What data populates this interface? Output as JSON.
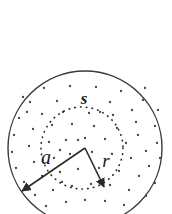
{
  "figure": {
    "type": "geometry-diagram",
    "canvas": {
      "width": 172,
      "height": 214,
      "background": "#ffffff"
    },
    "colors": {
      "outer_circle_stroke": "#3a3a3a",
      "inner_circle_stroke": "#2b2b2b",
      "point_fill": "#444444",
      "arrow_stroke": "#2a2a2a",
      "label_color": "#1a1a1a"
    },
    "outer_circle": {
      "name": "outer-circle",
      "center_x": 85,
      "center_y": 148,
      "radius": 77,
      "stroke_width": 1.4,
      "style": "solid"
    },
    "inner_circle": {
      "name": "inner-circle",
      "center_x": 82,
      "center_y": 148,
      "radius": 41,
      "stroke_width": 1.6,
      "style": "dotted"
    },
    "vertex": {
      "x": 85,
      "y": 148
    },
    "arrows": [
      {
        "id": "arrow-a",
        "label": "a",
        "from_x": 85,
        "from_y": 148,
        "to_x": 22,
        "to_y": 191,
        "label_x": 46,
        "label_y": 164,
        "meaning": "outer radius"
      },
      {
        "id": "arrow-r",
        "label": "r",
        "from_x": 85,
        "from_y": 148,
        "to_x": 104,
        "to_y": 187,
        "label_x": 106,
        "label_y": 167,
        "meaning": "inner radius"
      }
    ],
    "labels": [
      {
        "id": "label-s",
        "text": "s",
        "x": 84,
        "y": 104,
        "meaning": "arc or surface label on dotted circle"
      },
      {
        "id": "label-a",
        "text": "a",
        "x": 46,
        "y": 164,
        "meaning": "outer radius label"
      },
      {
        "id": "label-r",
        "text": "r",
        "x": 106,
        "y": 167,
        "meaning": "inner radius label"
      }
    ],
    "points": [
      [
        44,
        88
      ],
      [
        70,
        86
      ],
      [
        96,
        87
      ],
      [
        121,
        91
      ],
      [
        143,
        100
      ],
      [
        30,
        102
      ],
      [
        57,
        101
      ],
      [
        83,
        99
      ],
      [
        110,
        102
      ],
      [
        132,
        110
      ],
      [
        19,
        118
      ],
      [
        42,
        114
      ],
      [
        63,
        112
      ],
      [
        89,
        113
      ],
      [
        113,
        115
      ],
      [
        136,
        122
      ],
      [
        155,
        126
      ],
      [
        14,
        135
      ],
      [
        33,
        129
      ],
      [
        52,
        125
      ],
      [
        72,
        124
      ],
      [
        94,
        126
      ],
      [
        117,
        128
      ],
      [
        138,
        135
      ],
      [
        157,
        143
      ],
      [
        12,
        152
      ],
      [
        29,
        146
      ],
      [
        49,
        142
      ],
      [
        66,
        140
      ],
      [
        85,
        138
      ],
      [
        105,
        139
      ],
      [
        126,
        143
      ],
      [
        146,
        151
      ],
      [
        160,
        158
      ],
      [
        16,
        168
      ],
      [
        34,
        162
      ],
      [
        54,
        158
      ],
      [
        70,
        154
      ],
      [
        92,
        152
      ],
      [
        112,
        154
      ],
      [
        131,
        158
      ],
      [
        149,
        166
      ],
      [
        24,
        182
      ],
      [
        42,
        176
      ],
      [
        60,
        172
      ],
      [
        78,
        169
      ],
      [
        99,
        168
      ],
      [
        119,
        171
      ],
      [
        139,
        176
      ],
      [
        155,
        183
      ],
      [
        35,
        195
      ],
      [
        53,
        190
      ],
      [
        72,
        186
      ],
      [
        91,
        184
      ],
      [
        110,
        185
      ],
      [
        129,
        190
      ],
      [
        146,
        196
      ],
      [
        46,
        206
      ],
      [
        66,
        202
      ],
      [
        85,
        200
      ],
      [
        105,
        201
      ],
      [
        124,
        205
      ],
      [
        27,
        112
      ],
      [
        145,
        88
      ],
      [
        158,
        110
      ],
      [
        23,
        97
      ],
      [
        62,
        182
      ],
      [
        100,
        112
      ],
      [
        78,
        140
      ],
      [
        60,
        150
      ]
    ]
  }
}
